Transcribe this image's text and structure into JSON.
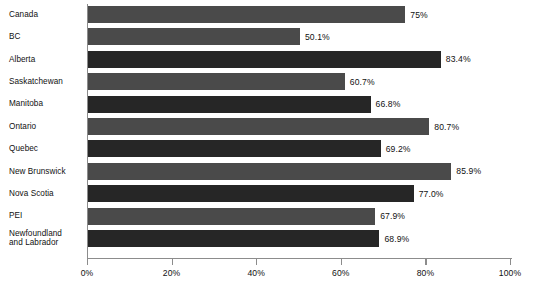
{
  "chart_data": {
    "type": "bar",
    "orientation": "horizontal",
    "title": "",
    "subtitle": "",
    "xlabel": "",
    "ylabel": "",
    "xlim": [
      0,
      100
    ],
    "grid": false,
    "legend": null,
    "categories": [
      "Canada",
      "BC",
      "Alberta",
      "Saskatchewan",
      "Manitoba",
      "Ontario",
      "Quebec",
      "New Brunswick",
      "Nova Scotia",
      "PEI",
      "Newfoundland\nand Labrador"
    ],
    "values": [
      75,
      50.1,
      83.4,
      60.7,
      66.8,
      80.7,
      69.2,
      85.9,
      77.0,
      67.9,
      68.9
    ],
    "data_labels": [
      "75%",
      "50.1%",
      "83.4%",
      "60.7%",
      "66.8%",
      "80.7%",
      "69.2%",
      "85.9%",
      "77.0%",
      "67.9%",
      "68.9%"
    ],
    "bar_colors": [
      "#4a4a4a",
      "#4a4a4a",
      "#262626",
      "#4a4a4a",
      "#262626",
      "#4a4a4a",
      "#262626",
      "#4a4a4a",
      "#262626",
      "#4a4a4a",
      "#262626"
    ],
    "xticks": [
      0,
      20,
      40,
      60,
      80,
      100
    ],
    "xtick_labels": [
      "0%",
      "20%",
      "40%",
      "60%",
      "80%",
      "100%"
    ],
    "axis_color": "#8c8c8c",
    "text_color": "#111111",
    "background_color": "#ffffff"
  }
}
